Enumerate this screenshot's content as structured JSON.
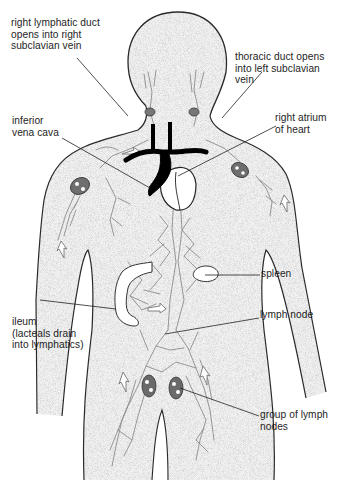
{
  "diagram": {
    "labels": {
      "right_lymphatic_duct": {
        "lines": [
          "right lymphatic duct",
          "opens into right",
          "subclavian vein"
        ]
      },
      "thoracic_duct": {
        "lines": [
          "thoracic duct opens",
          "into left subclavian",
          "vein"
        ]
      },
      "inferior_vena_cava": {
        "lines": [
          "inferior",
          "vena cava"
        ]
      },
      "right_atrium": {
        "lines": [
          "right atrium",
          "of heart"
        ]
      },
      "spleen": {
        "lines": [
          "spleen"
        ]
      },
      "ileum": {
        "lines": [
          "ileum",
          "(lacteals drain",
          "into lymphatics)"
        ]
      },
      "lymph_node": {
        "lines": [
          "lymph node"
        ]
      },
      "group_of_lymph_nodes": {
        "lines": [
          "group of lymph",
          "nodes"
        ]
      }
    },
    "colors": {
      "body_fill": "#efefef",
      "outline": "#2a2a2a",
      "vessels": "#8a8a8a",
      "veins": "#000000",
      "text": "#1e1e1e"
    }
  }
}
